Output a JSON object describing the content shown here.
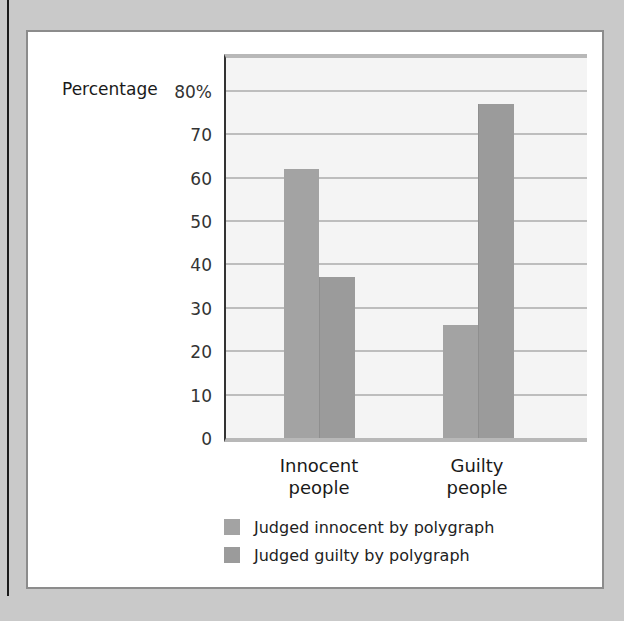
{
  "chart_data": {
    "type": "bar",
    "title": "",
    "xlabel": "",
    "ylabel": "Percentage",
    "ylim": [
      0,
      80
    ],
    "yticks": [
      "0",
      "10",
      "20",
      "30",
      "40",
      "50",
      "60",
      "70",
      "80%"
    ],
    "categories": [
      "Innocent people",
      "Guilty people"
    ],
    "series": [
      {
        "name": "Judged innocent by polygraph",
        "values": [
          62,
          26
        ],
        "color": "#a3a3a3"
      },
      {
        "name": "Judged guilty by polygraph",
        "values": [
          37,
          77
        ],
        "color": "#9b9b9b"
      }
    ],
    "grid": true,
    "legend_position": "bottom"
  },
  "axis": {
    "ylabel": "Percentage",
    "ticks": [
      "80%",
      "70",
      "60",
      "50",
      "40",
      "30",
      "20",
      "10",
      "0"
    ]
  },
  "categories": [
    {
      "line1": "Innocent",
      "line2": "people"
    },
    {
      "line1": "Guilty",
      "line2": "people"
    }
  ],
  "legend": [
    {
      "label": "Judged innocent by polygraph"
    },
    {
      "label": "Judged guilty by polygraph"
    }
  ]
}
